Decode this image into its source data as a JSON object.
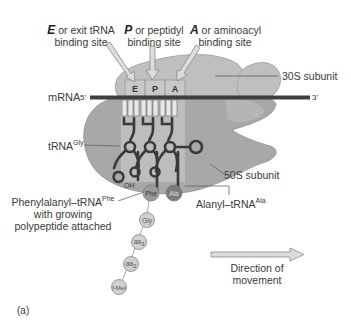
{
  "figure": {
    "panel_label": "(a)",
    "sites": [
      {
        "letter": "E",
        "desc_line1": " or exit tRNA",
        "desc_line2": "binding site"
      },
      {
        "letter": "P",
        "desc_line1": " or peptidyl",
        "desc_line2": "binding site"
      },
      {
        "letter": "A",
        "desc_line1": " or aminoacyl",
        "desc_line2": "binding site"
      }
    ],
    "mrna": {
      "label": "mRNA",
      "five_prime": "5'",
      "three_prime": "3'"
    },
    "subunits": {
      "small": "30S subunit",
      "large": "50S subunit"
    },
    "trna_gly": {
      "base": "tRNA",
      "sup": "Gly"
    },
    "oh_label": "OH",
    "phe_trna": {
      "base": "Phenylalanyl–tRNA",
      "sup": "Phe",
      "line2": "with growing",
      "line3": "polypeptide attached"
    },
    "ala_trna": {
      "base": "Alanyl–tRNA",
      "sup": "Ala"
    },
    "amino_acids": [
      {
        "label": "Phe",
        "color": "#9a9a9a"
      },
      {
        "label": "Ala",
        "color": "#7a7a7a"
      },
      {
        "label": "Gly",
        "color": "#cfcfcf"
      },
      {
        "label": "aa",
        "sub": "3",
        "color": "#cfcfcf"
      },
      {
        "label": "aa",
        "sub": "2",
        "color": "#cfcfcf"
      },
      {
        "label": "f-Met",
        "color": "#cfcfcf"
      }
    ],
    "direction": {
      "line1": "Direction of",
      "line2": "movement"
    },
    "colors": {
      "small_subunit": "#bdbdbd",
      "large_subunit": "#a6a6a6",
      "mrna": "#3f3f3f",
      "trna": "#3a3a3a",
      "arrow_fill": "#dcdcdc",
      "arrow_stroke": "#8a8a8a"
    }
  }
}
